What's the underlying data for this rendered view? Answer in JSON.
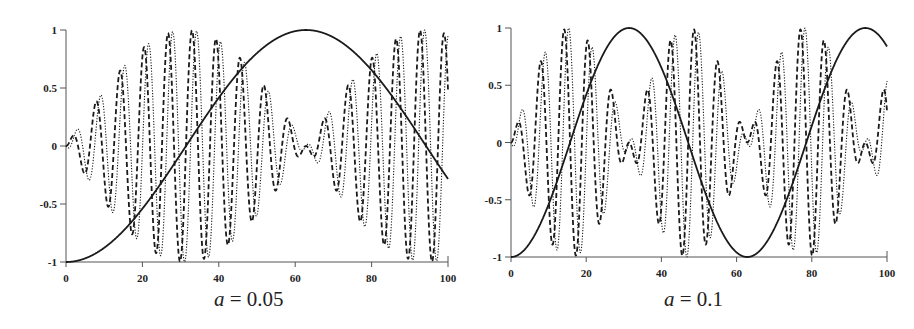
{
  "chart_data": [
    {
      "type": "line",
      "title": "",
      "caption": {
        "var": "a",
        "rest": " = 0.05"
      },
      "xlabel": "",
      "ylabel": "",
      "xlim": [
        0,
        100
      ],
      "ylim": [
        -1,
        1
      ],
      "x_ticks": [
        0,
        20,
        40,
        60,
        80,
        100
      ],
      "y_ticks": [
        -1,
        -0.5,
        0,
        0.5,
        1
      ],
      "y_tick_labels": [
        "-1",
        "-0.5",
        "0",
        "0.5",
        "1"
      ],
      "grid": false,
      "legend": null,
      "params": {
        "a": 0.05,
        "omega": 1.0
      },
      "series": [
        {
          "name": "solid",
          "style": "solid",
          "formula": "-cos(a*t)",
          "key_points": [
            [
              0,
              -1
            ],
            [
              20,
              -0.54
            ],
            [
              31.4,
              0
            ],
            [
              40,
              0.42
            ],
            [
              62.8,
              1
            ],
            [
              80,
              0.65
            ],
            [
              100,
              -0.28
            ]
          ]
        },
        {
          "name": "dashed",
          "style": "dashed",
          "formula": "sin(a*t)*sin(omega*t)",
          "envelope": "|sin(a*t)|",
          "envelope_peaks": [
            31.4,
            94.2
          ],
          "envelope_zeros": [
            0,
            62.8
          ]
        },
        {
          "name": "dotted",
          "style": "dotted",
          "formula": "sin(a*t)*sin(omega*t - 1.2)",
          "envelope": "|sin(a*t)|",
          "envelope_peaks": [
            31.4,
            94.2
          ],
          "envelope_zeros": [
            0,
            62.8
          ]
        }
      ],
      "frame": {
        "x0": 66,
        "x1": 448,
        "y_top": 30,
        "y_bottom": 262
      }
    },
    {
      "type": "line",
      "title": "",
      "caption": {
        "var": "a",
        "rest": " = 0.1"
      },
      "xlabel": "",
      "ylabel": "",
      "xlim": [
        0,
        100
      ],
      "ylim": [
        -1,
        1
      ],
      "x_ticks": [
        0,
        20,
        40,
        60,
        80,
        100
      ],
      "y_ticks": [
        -1,
        -0.5,
        0,
        0.5,
        1
      ],
      "y_tick_labels": [
        "-1",
        "-0.5",
        "0",
        "0.5",
        "1"
      ],
      "grid": false,
      "legend": null,
      "params": {
        "a": 0.1,
        "omega": 1.0
      },
      "series": [
        {
          "name": "solid",
          "style": "solid",
          "formula": "-cos(a*t)",
          "key_points": [
            [
              0,
              -1
            ],
            [
              15.7,
              0
            ],
            [
              31.4,
              1
            ],
            [
              47.1,
              0
            ],
            [
              62.8,
              -1
            ],
            [
              78.5,
              0
            ],
            [
              94.2,
              1
            ],
            [
              100,
              0.84
            ]
          ]
        },
        {
          "name": "dashed",
          "style": "dashed",
          "formula": "sin(a*t)*sin(omega*t)",
          "envelope": "|sin(a*t)|",
          "envelope_peaks": [
            15.7,
            47.1,
            78.5
          ],
          "envelope_zeros": [
            0,
            31.4,
            62.8,
            94.2
          ]
        },
        {
          "name": "dotted",
          "style": "dotted",
          "formula": "sin(a*t)*sin(omega*t - 1.2)",
          "envelope": "|sin(a*t)|",
          "envelope_peaks": [
            15.7,
            47.1,
            78.5
          ],
          "envelope_zeros": [
            0,
            31.4,
            62.8,
            94.2
          ]
        }
      ],
      "frame": {
        "x0": 53,
        "x1": 429,
        "y_top": 28,
        "y_bottom": 257
      }
    }
  ],
  "colors": {
    "line": "#1a1a1a",
    "axis": "#555555",
    "text": "#222222"
  }
}
